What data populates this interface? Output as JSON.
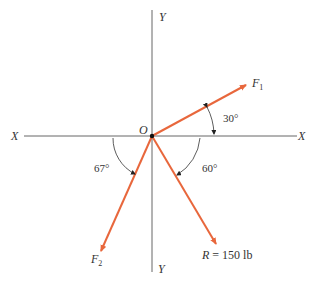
{
  "diagram": {
    "type": "force-vector-diagram",
    "axes": {
      "x_left_label": "X",
      "x_right_label": "X",
      "y_top_label": "Y",
      "y_bottom_label": "Y",
      "origin_label": "O"
    },
    "vectors": [
      {
        "name": "F",
        "subscript": "1",
        "angle_label": "30°",
        "reference": "positive X axis, above"
      },
      {
        "name": "F",
        "subscript": "2",
        "angle_label": "67°",
        "reference": "negative X axis, below"
      },
      {
        "name": "R",
        "value_label": "= 150 lb",
        "angle_label": "60°",
        "reference": "positive X axis, below"
      }
    ],
    "colors": {
      "vector": "#e8673c",
      "axis": "#555555",
      "arc": "#333333"
    }
  }
}
